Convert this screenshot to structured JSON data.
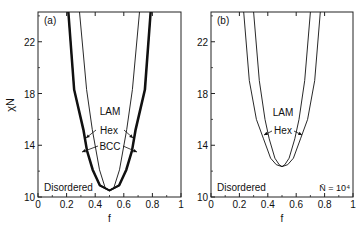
{
  "chart_data": [
    {
      "type": "line",
      "panel_label": "(a)",
      "xlabel": "f",
      "ylabel": "χN",
      "xlim": [
        0,
        1
      ],
      "ylim": [
        10,
        24.3
      ],
      "xticks": [
        "0",
        "0.2",
        "0.4",
        "0.6",
        "0.8",
        "1"
      ],
      "yticks": [
        "10",
        "14",
        "18",
        "22"
      ],
      "grid": false,
      "annotations": [
        "LAM",
        "Hex",
        "BCC",
        "Disordered"
      ],
      "series": [
        {
          "name": "Disordered/BCC boundary",
          "style": "thick",
          "points": [
            [
              0.21,
              24.3
            ],
            [
              0.25,
              18.3
            ],
            [
              0.315,
              15.2
            ],
            [
              0.34,
              13.6
            ],
            [
              0.38,
              12.1
            ],
            [
              0.43,
              10.9
            ],
            [
              0.5,
              10.5
            ],
            [
              0.57,
              10.9
            ],
            [
              0.62,
              12.1
            ],
            [
              0.66,
              13.6
            ],
            [
              0.685,
              15.2
            ],
            [
              0.75,
              18.3
            ],
            [
              0.79,
              24.3
            ]
          ]
        },
        {
          "name": "BCC/Hex boundary",
          "style": "thick",
          "points": [
            [
              0.215,
              24.3
            ],
            [
              0.255,
              18.3
            ],
            [
              0.32,
              15.2
            ],
            [
              0.345,
              13.6
            ],
            [
              0.385,
              12.1
            ],
            [
              0.435,
              10.9
            ],
            [
              0.5,
              10.5
            ],
            [
              0.565,
              10.9
            ],
            [
              0.615,
              12.1
            ],
            [
              0.655,
              13.6
            ],
            [
              0.68,
              15.2
            ],
            [
              0.745,
              18.3
            ],
            [
              0.785,
              24.3
            ]
          ]
        },
        {
          "name": "Hex/LAM boundary",
          "style": "thin",
          "points": [
            [
              0.29,
              24.3
            ],
            [
              0.34,
              18.3
            ],
            [
              0.38,
              15.2
            ],
            [
              0.43,
              12.1
            ],
            [
              0.47,
              10.7
            ],
            [
              0.5,
              10.5
            ],
            [
              0.53,
              10.7
            ],
            [
              0.57,
              12.1
            ],
            [
              0.62,
              15.2
            ],
            [
              0.66,
              18.3
            ],
            [
              0.71,
              24.3
            ]
          ]
        }
      ]
    },
    {
      "type": "line",
      "panel_label": "(b)",
      "xlabel": "f",
      "ylabel": "",
      "xlim": [
        0,
        1
      ],
      "ylim": [
        10,
        24.3
      ],
      "xticks": [
        "0",
        "0.2",
        "0.4",
        "0.6",
        "0.8",
        "1"
      ],
      "yticks": [
        "10",
        "14",
        "18",
        "22"
      ],
      "grid": false,
      "annotations": [
        "LAM",
        "Hex",
        "Disordered",
        "N̄ = 10⁴"
      ],
      "series": [
        {
          "name": "Disordered/Hex boundary",
          "style": "thin",
          "points": [
            [
              0.23,
              24.3
            ],
            [
              0.27,
              19
            ],
            [
              0.32,
              16
            ],
            [
              0.37,
              14.5
            ],
            [
              0.42,
              13
            ],
            [
              0.46,
              12.5
            ],
            [
              0.5,
              12.35
            ],
            [
              0.54,
              12.5
            ],
            [
              0.58,
              13
            ],
            [
              0.63,
              14.5
            ],
            [
              0.68,
              16
            ],
            [
              0.73,
              19
            ],
            [
              0.77,
              24.3
            ]
          ]
        },
        {
          "name": "Hex/LAM boundary",
          "style": "thin",
          "points": [
            [
              0.3,
              24.3
            ],
            [
              0.34,
              19
            ],
            [
              0.38,
              16
            ],
            [
              0.41,
              14.5
            ],
            [
              0.45,
              13
            ],
            [
              0.48,
              12.5
            ],
            [
              0.5,
              12.35
            ],
            [
              0.52,
              12.5
            ],
            [
              0.55,
              13
            ],
            [
              0.59,
              14.5
            ],
            [
              0.62,
              16
            ],
            [
              0.66,
              19
            ],
            [
              0.7,
              24.3
            ]
          ]
        }
      ]
    }
  ],
  "panels": {
    "a": {
      "label": "(a)",
      "ylabel": "χN",
      "xlabel": "f",
      "lam": "LAM",
      "hex": "Hex",
      "bcc": "BCC",
      "disordered": "Disordered"
    },
    "b": {
      "label": "(b)",
      "xlabel": "f",
      "lam": "LAM",
      "hex": "Hex",
      "disordered": "Disordered",
      "nbar": "N̄ = 10⁴"
    }
  }
}
